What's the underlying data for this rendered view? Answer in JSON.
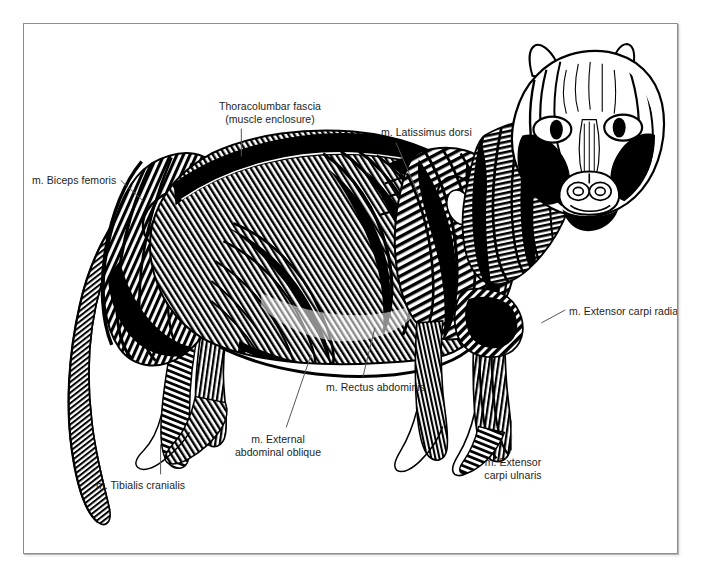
{
  "figure": {
    "view": "left lateral",
    "style": "black-and-white woodcut / engraving line art",
    "caption": "",
    "frame_color": "#8d8d8d",
    "ink_color": "#000000",
    "paper_color": "#ffffff",
    "leader_color": "#555555"
  },
  "labels": [
    {
      "id": "thoracolumbar-fascia",
      "line1": "Thoracolumbar fascia",
      "line2": "(muscle enclosure)",
      "align": "center",
      "x": 178,
      "y": 76,
      "width": 136,
      "leader": {
        "x1": 218,
        "y1": 105,
        "x2": 218,
        "y2": 133
      }
    },
    {
      "id": "latissimus-dorsi",
      "line1": "m. Latissimus dorsi",
      "line2": "",
      "align": "left",
      "x": 357,
      "y": 102,
      "width": 110,
      "leader": {
        "x1": 373,
        "y1": 119,
        "x2": 396,
        "y2": 172
      }
    },
    {
      "id": "biceps-femoris",
      "line1": "m. Biceps femoris",
      "line2": "",
      "align": "left",
      "x": 8,
      "y": 150,
      "width": 100,
      "leader": {
        "x1": 97,
        "y1": 157,
        "x2": 119,
        "y2": 177
      }
    },
    {
      "id": "extensor-carpi-radialis",
      "line1": "m. Extensor carpi radialis",
      "line2": "",
      "align": "left",
      "x": 545,
      "y": 281,
      "width": 140,
      "leader": {
        "x1": 543,
        "y1": 287,
        "x2": 519,
        "y2": 300
      }
    },
    {
      "id": "rectus-abdominis",
      "line1": "m. Rectus abdominis",
      "line2": "",
      "align": "left",
      "x": 302,
      "y": 357,
      "width": 120,
      "leader": {
        "x1": 340,
        "y1": 354,
        "x2": 352,
        "y2": 305
      }
    },
    {
      "id": "external-abdominal-oblique",
      "line1": "m. External",
      "line2": "abdominal oblique",
      "align": "center",
      "x": 199,
      "y": 409,
      "width": 110,
      "leader": {
        "x1": 263,
        "y1": 405,
        "x2": 288,
        "y2": 332
      }
    },
    {
      "id": "tibialis-cranialis",
      "line1": "m. Tibialis cranialis",
      "line2": "",
      "align": "left",
      "x": 72,
      "y": 455,
      "width": 110,
      "leader": {
        "x1": 137,
        "y1": 422,
        "x2": 137,
        "y2": 452
      }
    },
    {
      "id": "extensor-carpi-ulnaris",
      "line1": "m. Extensor",
      "line2": "carpi ulnaris",
      "align": "center",
      "x": 442,
      "y": 432,
      "width": 94,
      "leader": {
        "x1": 489,
        "y1": 398,
        "x2": 489,
        "y2": 428
      }
    }
  ],
  "anatomy_regions": [
    {
      "id": "head",
      "name": "head with facial musculature and exposed eyes"
    },
    {
      "id": "neck",
      "name": "cervical musculature"
    },
    {
      "id": "shoulder",
      "name": "scapular region / shoulder"
    },
    {
      "id": "thorax",
      "name": "rib cage with serratus and intercostal hatching"
    },
    {
      "id": "abdomen",
      "name": "abdominal wall"
    },
    {
      "id": "hindquarter",
      "name": "gluteal and thigh musculature"
    },
    {
      "id": "foreleg",
      "name": "forelimb"
    },
    {
      "id": "hindleg",
      "name": "hindlimb"
    },
    {
      "id": "tail",
      "name": "tail"
    }
  ]
}
